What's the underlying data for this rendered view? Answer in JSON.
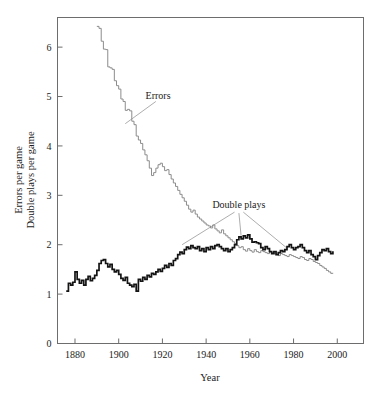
{
  "chart_data": {
    "type": "line",
    "title": "",
    "xlabel": "Year",
    "ylabel": "Errors per game\nDouble plays per game",
    "ylabel_line1": "Errors per game",
    "ylabel_line2": "Double plays per game",
    "xlim": [
      1872,
      2012
    ],
    "ylim": [
      0,
      6.6
    ],
    "xticks": [
      1880,
      1900,
      1920,
      1940,
      1960,
      1980,
      2000
    ],
    "xtick_labels": [
      "1880",
      "1900",
      "1920",
      "1940",
      "1960",
      "1980",
      "2000"
    ],
    "yticks": [
      0,
      1,
      2,
      3,
      4,
      5,
      6
    ],
    "ytick_labels": [
      "0",
      "1",
      "2",
      "3",
      "4",
      "5",
      "6"
    ],
    "grid": false,
    "legend": "none",
    "annotations": [
      {
        "name": "errors-annotation",
        "text": "Errors",
        "x": 1918,
        "y": 4.95
      },
      {
        "name": "double-plays-annotation",
        "text": "Double plays",
        "x": 1955,
        "y": 2.74
      }
    ],
    "leader_lines": [
      {
        "name": "errors-leader",
        "from": [
          1917,
          4.9
        ],
        "to": [
          1903,
          4.45
        ]
      },
      {
        "name": "double-plays-leader-left",
        "from": [
          1953,
          2.66
        ],
        "to": [
          1929,
          2.0
        ]
      },
      {
        "name": "double-plays-leader-mid",
        "from": [
          1955,
          2.64
        ],
        "to": [
          1956,
          2.18
        ]
      },
      {
        "name": "double-plays-leader-right",
        "from": [
          1957,
          2.66
        ],
        "to": [
          1977,
          1.93
        ]
      }
    ],
    "series": [
      {
        "name": "Errors",
        "color": "#8c8c8c",
        "style": "step",
        "x_start": 1890,
        "x_end": 1998,
        "values": [
          6.42,
          6.38,
          6.12,
          5.96,
          5.95,
          5.6,
          5.58,
          5.55,
          5.32,
          5.22,
          5.15,
          4.95,
          4.9,
          4.72,
          4.74,
          4.71,
          4.5,
          4.43,
          4.2,
          4.12,
          4.05,
          3.92,
          3.82,
          3.7,
          3.55,
          3.4,
          3.46,
          3.55,
          3.62,
          3.65,
          3.58,
          3.5,
          3.52,
          3.42,
          3.33,
          3.25,
          3.18,
          3.1,
          3.02,
          2.95,
          2.88,
          2.8,
          2.72,
          2.66,
          2.7,
          2.62,
          2.56,
          2.52,
          2.48,
          2.44,
          2.4,
          2.38,
          2.34,
          2.4,
          2.32,
          2.28,
          2.24,
          2.3,
          2.22,
          2.18,
          2.14,
          2.1,
          2.06,
          2.02,
          1.98,
          1.94,
          1.96,
          1.9,
          1.87,
          1.92,
          1.88,
          1.85,
          1.9,
          1.86,
          1.84,
          1.88,
          1.86,
          1.84,
          1.82,
          1.86,
          1.84,
          1.82,
          1.8,
          1.78,
          1.82,
          1.8,
          1.78,
          1.76,
          1.8,
          1.78,
          1.76,
          1.74,
          1.72,
          1.76,
          1.74,
          1.7,
          1.68,
          1.72,
          1.7,
          1.66,
          1.64,
          1.62,
          1.58,
          1.55,
          1.52,
          1.48,
          1.45,
          1.42,
          1.43
        ]
      },
      {
        "name": "Double plays",
        "color": "#141414",
        "style": "step",
        "x_start": 1876,
        "x_end": 1998,
        "values": [
          1.06,
          1.22,
          1.18,
          1.24,
          1.45,
          1.3,
          1.22,
          1.28,
          1.18,
          1.3,
          1.36,
          1.27,
          1.32,
          1.38,
          1.48,
          1.62,
          1.68,
          1.7,
          1.62,
          1.55,
          1.6,
          1.5,
          1.45,
          1.48,
          1.4,
          1.32,
          1.28,
          1.34,
          1.22,
          1.18,
          1.15,
          1.2,
          1.06,
          1.3,
          1.26,
          1.34,
          1.3,
          1.38,
          1.35,
          1.42,
          1.4,
          1.45,
          1.5,
          1.46,
          1.52,
          1.58,
          1.54,
          1.62,
          1.58,
          1.68,
          1.72,
          1.8,
          1.85,
          1.82,
          1.9,
          1.95,
          1.92,
          1.98,
          1.94,
          1.92,
          1.96,
          1.88,
          1.92,
          1.86,
          1.94,
          1.9,
          1.96,
          1.92,
          1.98,
          2.0,
          1.96,
          1.92,
          1.88,
          1.92,
          1.86,
          1.9,
          1.94,
          2.0,
          2.1,
          2.16,
          2.12,
          2.18,
          2.14,
          2.2,
          2.12,
          2.05,
          2.06,
          2.04,
          2.02,
          1.94,
          1.9,
          1.96,
          1.92,
          1.86,
          1.82,
          1.86,
          1.8,
          1.84,
          1.88,
          1.86,
          1.9,
          1.96,
          2.0,
          1.94,
          1.9,
          1.94,
          1.96,
          2.0,
          1.94,
          1.88,
          1.84,
          1.88,
          1.8,
          1.76,
          1.7,
          1.78,
          1.84,
          1.9,
          1.88,
          1.92,
          1.86,
          1.82,
          1.87
        ]
      }
    ]
  }
}
